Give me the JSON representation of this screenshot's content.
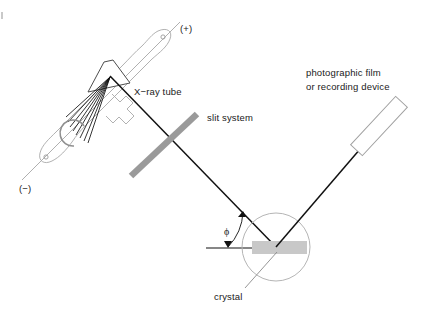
{
  "figure": {
    "background_color": "#ffffff",
    "width": 437,
    "height": 313
  },
  "colors": {
    "beam": "#111111",
    "tube_outline": "#a8a8a8",
    "lead_line": "#b0b0b0",
    "slit_bar": "#9a9a9a",
    "crystal_fill": "#c8c8c8",
    "crystal_circle": "#b5b5b5",
    "detector_outline": "#a0a0a0",
    "text": "#1a1a1a",
    "filament": "#111111"
  },
  "labels": {
    "anode_terminal": "(+)",
    "cathode_terminal": "(−)",
    "xray_tube": "X−ray tube",
    "slit_system": "slit system",
    "detector_line1": "photographic film",
    "detector_line2": "or recording device",
    "crystal": "crystal",
    "angle_symbol": "ϕ"
  },
  "components": [
    {
      "name": "x-ray-tube",
      "label": "X−ray tube",
      "description": "evacuated glass tube with cathode filament and angled anode target"
    },
    {
      "name": "anode-terminal",
      "label": "(+)",
      "description": "positive high-voltage lead at upper right of tube"
    },
    {
      "name": "cathode-terminal",
      "label": "(−)",
      "description": "negative high-voltage lead at lower left of tube"
    },
    {
      "name": "slit-system",
      "label": "slit system",
      "description": "collimating slit bar across the incident beam"
    },
    {
      "name": "crystal",
      "label": "crystal",
      "description": "flat specimen at centre of goniometer circle"
    },
    {
      "name": "detector",
      "label": "photographic film or recording device",
      "description": "tilted recording plate intercepting the diffracted beam"
    },
    {
      "name": "bragg-angle",
      "label": "ϕ",
      "description": "glancing angle between incident beam and crystal surface plane"
    }
  ],
  "geometry": {
    "focal_spot": {
      "x": 110,
      "y": 76
    },
    "crystal_center": {
      "x": 276,
      "y": 247
    },
    "detector_center": {
      "x": 379,
      "y": 126
    },
    "circle_radius": 34,
    "tube_axis_degrees": 45
  }
}
